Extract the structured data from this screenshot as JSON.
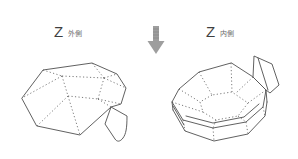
{
  "diagram": {
    "background_color": "#ffffff",
    "line_color": "#4f4f4f",
    "label_color": "#3f3f3f",
    "sublabel_color": "#6b6b6b",
    "arrow_color": "#9e9e9e",
    "left_view": {
      "label": "Z",
      "sublabel": "外側"
    },
    "right_view": {
      "label": "Z",
      "sublabel": "内側"
    }
  }
}
